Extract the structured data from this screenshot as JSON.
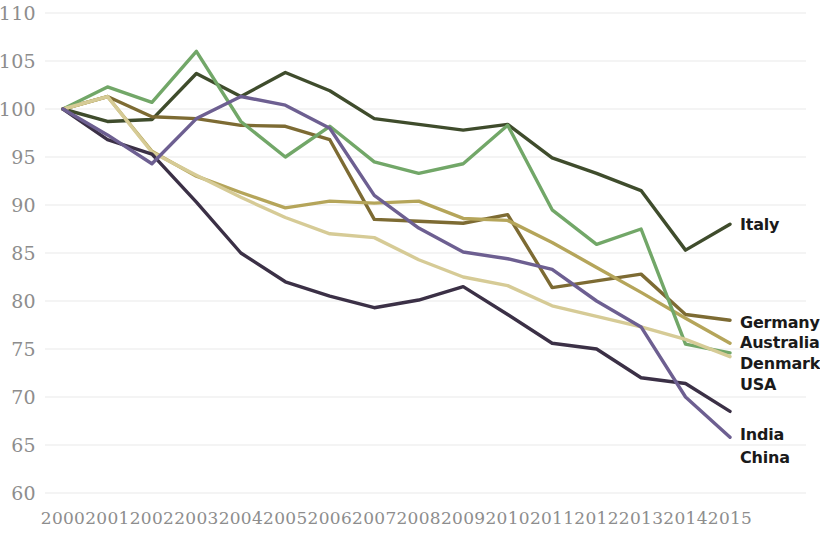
{
  "chart_data": {
    "type": "line",
    "title": "",
    "subtitle": "",
    "xlabel": "",
    "ylabel": "",
    "grid": true,
    "legend_position": "right-end-labels",
    "categories": [
      "2000",
      "2001",
      "2002",
      "2003",
      "2004",
      "2005",
      "2006",
      "2007",
      "2008",
      "2009",
      "2010",
      "2011",
      "2012",
      "2013",
      "2014",
      "2015"
    ],
    "x": [
      2000,
      2001,
      2002,
      2003,
      2004,
      2005,
      2006,
      2007,
      2008,
      2009,
      2010,
      2011,
      2012,
      2013,
      2014,
      2015
    ],
    "xlim": [
      2000,
      2015
    ],
    "ylim": [
      60,
      110
    ],
    "ytick_values": [
      60,
      65,
      70,
      75,
      80,
      85,
      90,
      95,
      100,
      105,
      110
    ],
    "ytick_labels": [
      "60",
      "65",
      "70",
      "75",
      "80",
      "85",
      "90",
      "95",
      "100",
      "105",
      "110"
    ],
    "series": [
      {
        "name": "Italy",
        "color": "#3f4c2c",
        "values": [
          100,
          98.7,
          98.9,
          103.7,
          101.3,
          103.8,
          101.9,
          99.0,
          98.4,
          97.8,
          98.4,
          94.9,
          93.3,
          91.5,
          85.3,
          88.0
        ]
      },
      {
        "name": "Germany",
        "color": "#7d6b33",
        "values": [
          100,
          101.3,
          99.2,
          99.0,
          98.3,
          98.2,
          96.8,
          88.5,
          88.3,
          88.1,
          89.0,
          81.4,
          82.1,
          82.8,
          78.6,
          78.0
        ]
      },
      {
        "name": "Australia",
        "color": "#b5a55a",
        "values": [
          100,
          101.3,
          95.6,
          93.0,
          91.3,
          89.7,
          90.4,
          90.2,
          90.4,
          88.6,
          88.4,
          86.1,
          83.5,
          80.9,
          78.2,
          75.6
        ]
      },
      {
        "name": "Denmark",
        "color": "#72a768",
        "values": [
          100,
          102.3,
          100.7,
          106.0,
          98.7,
          95.0,
          98.2,
          94.5,
          93.3,
          94.3,
          98.3,
          89.5,
          85.9,
          87.5,
          75.5,
          74.6
        ]
      },
      {
        "name": "USA",
        "color": "#d6cb96",
        "values": [
          100,
          101.3,
          95.5,
          93.1,
          90.8,
          88.7,
          87.0,
          86.6,
          84.3,
          82.5,
          81.6,
          79.5,
          78.4,
          77.3,
          76.0,
          74.2
        ]
      },
      {
        "name": "India",
        "color": "#3b3046",
        "values": [
          100,
          96.8,
          95.3,
          90.3,
          85.0,
          82.0,
          80.5,
          79.3,
          80.1,
          81.5,
          78.6,
          75.6,
          75.0,
          72.0,
          71.4,
          68.5
        ]
      },
      {
        "name": "China",
        "color": "#6d5f91",
        "values": [
          100,
          97.3,
          94.3,
          99.0,
          101.3,
          100.4,
          98.0,
          91.0,
          87.6,
          85.1,
          84.4,
          83.3,
          80.0,
          77.3,
          70.0,
          65.8
        ]
      }
    ],
    "series_end_labels": [
      {
        "name": "Italy",
        "value_label": "Italy"
      },
      {
        "name": "Germany",
        "value_label": "Germany"
      },
      {
        "name": "Australia",
        "value_label": "Australia"
      },
      {
        "name": "Denmark",
        "value_label": "Denmark"
      },
      {
        "name": "USA",
        "value_label": "USA"
      },
      {
        "name": "India",
        "value_label": "India"
      },
      {
        "name": "China",
        "value_label": "China"
      }
    ]
  }
}
